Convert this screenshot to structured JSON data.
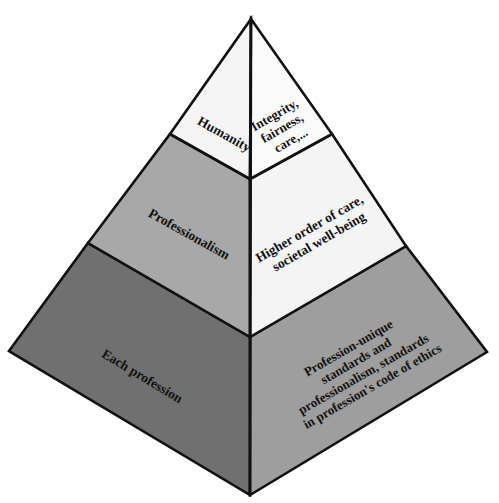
{
  "diagram": {
    "type": "layered-pyramid",
    "colors": {
      "tier1_left": "#f5f5f5",
      "tier1_right": "#fafafa",
      "tier2_left": "#a8a8a8",
      "tier2_right": "#f4f4f4",
      "tier3_left": "#707070",
      "tier3_right": "#9e9e9e",
      "outline": "#111111"
    },
    "tiers": [
      {
        "name": "Humanity",
        "left_label": [
          "Humanity"
        ],
        "right_label": [
          "Integrity,",
          "fairness,",
          "care,..."
        ]
      },
      {
        "name": "Professionalism",
        "left_label": [
          "Professionalism"
        ],
        "right_label": [
          "Higher order of care,",
          "societal well-being"
        ]
      },
      {
        "name": "Each profession",
        "left_label": [
          "Each profession"
        ],
        "right_label": [
          "Profession-unique",
          "standards and",
          "professionalism, standards",
          "in profession's code of ethics"
        ]
      }
    ]
  }
}
